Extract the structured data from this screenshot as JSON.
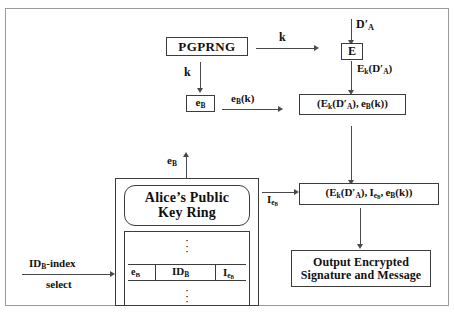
{
  "diagram": {
    "nodes": {
      "pgprng": "PGPRNG",
      "e_box": "E",
      "eb_box": "eB",
      "pair_box": "(Eₖ(D′ₐ), eB(k))",
      "triple_box": "(Eₖ(D′ₐ), IₑB, eB(k))",
      "keyring_label_line1": "Alice’s Public",
      "keyring_label_line2": "Key Ring",
      "output_line1": "Output Encrypted",
      "output_line2": "Signature and Message"
    },
    "edge_labels": {
      "k_right": "k",
      "k_down": "k",
      "eb_k": "eB(k)",
      "d_prime_a": "D′ₐ",
      "ek_d_prime_a": "Eₖ(D′ₐ)",
      "i_eb": "IₑB",
      "eb_up": "eB",
      "idb_index": "IDB-index",
      "select": "select"
    },
    "keyring_table": {
      "columns": [
        "eB",
        "IDB",
        "IₑB"
      ],
      "rows_above": "⋮",
      "rows_below": "⋮"
    },
    "colors": {
      "line": "#3c3c3c",
      "arrow": "#4a4a4a",
      "frame": "#9a9a9a",
      "text": "#111111",
      "background": "#ffffff"
    }
  }
}
